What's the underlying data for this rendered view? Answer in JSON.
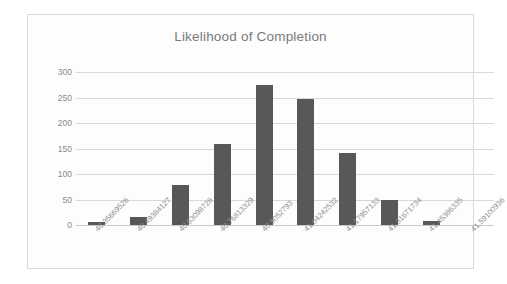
{
  "chart_data": {
    "type": "bar",
    "title": "Likelihood of Completion",
    "xlabel": "",
    "ylabel": "",
    "categories": [
      "40.35669526",
      "40.49384127",
      "40.63098728",
      "40.76813329",
      "40.9052793",
      "41.04242532",
      "41.17957133",
      "41.31671734",
      "41.45386335",
      "41.59100936"
    ],
    "values": [
      6,
      16,
      78,
      159,
      274,
      248,
      141,
      50,
      8,
      0
    ],
    "ylim": [
      0,
      300
    ],
    "y_ticks": [
      0,
      50,
      100,
      150,
      200,
      250,
      300
    ],
    "y_tick_labels": [
      "0",
      "50",
      "100",
      "150",
      "200",
      "250",
      "300"
    ],
    "grid": true,
    "legend": false,
    "bar_color": "#585858",
    "gridline_color": "#d9d9d9",
    "title_color": "#7a7a7a",
    "tick_label_color": "#8a8a8a",
    "plot_background": "#fdfdfd",
    "frame_border_color": "#d8d8d8"
  }
}
